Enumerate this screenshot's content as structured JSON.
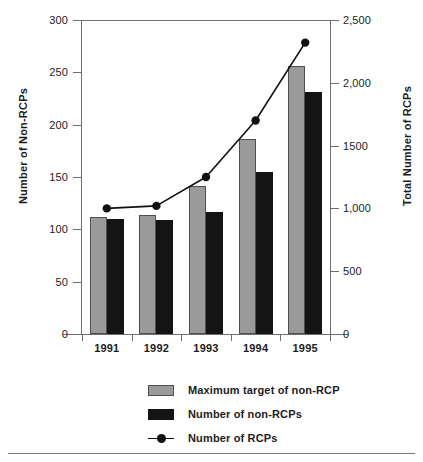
{
  "chart_data": {
    "type": "bar",
    "title": "",
    "subtitle": "",
    "categories": [
      "1991",
      "1992",
      "1993",
      "1994",
      "1995"
    ],
    "xlabel": "",
    "grid": false,
    "legend_position": "bottom-center",
    "left_axis": {
      "label": "Number of Non-RCPs",
      "ylim": [
        0,
        300
      ],
      "ticks": [
        0,
        50,
        100,
        150,
        200,
        250,
        300
      ],
      "ticklabels": [
        "0",
        "50",
        "100",
        "150",
        "200",
        "250",
        "300"
      ]
    },
    "right_axis": {
      "label": "Total Number of RCPs",
      "ylim": [
        0,
        2500
      ],
      "ticks": [
        0,
        500,
        1000,
        1500,
        2000,
        2500
      ],
      "ticklabels": [
        "0",
        "500",
        "1,000",
        "1500",
        "2,000",
        "2,500"
      ]
    },
    "series": [
      {
        "name": "Maximum target of non-RCP",
        "kind": "bar",
        "axis": "left",
        "color": "#9a9a9a",
        "values": [
          112,
          114,
          141,
          186,
          256
        ]
      },
      {
        "name": "Number of non-RCPs",
        "kind": "bar",
        "axis": "left",
        "color": "#141414",
        "values": [
          110,
          109,
          117,
          155,
          231
        ]
      },
      {
        "name": "Number of RCPs",
        "kind": "line",
        "axis": "right",
        "color": "#111111",
        "marker": "filled-circle",
        "values": [
          1000,
          1020,
          1250,
          1700,
          2320
        ]
      }
    ]
  },
  "legend": {
    "items": [
      {
        "label": "Maximum target of non-RCP",
        "swatch": "target"
      },
      {
        "label": "Number of non-RCPs",
        "swatch": "actual"
      },
      {
        "label": "Number of RCPs",
        "swatch": "lineMarker"
      }
    ]
  },
  "axis_titles": {
    "left": "Number of Non-RCPs",
    "right": "Total Number of RCPs"
  }
}
